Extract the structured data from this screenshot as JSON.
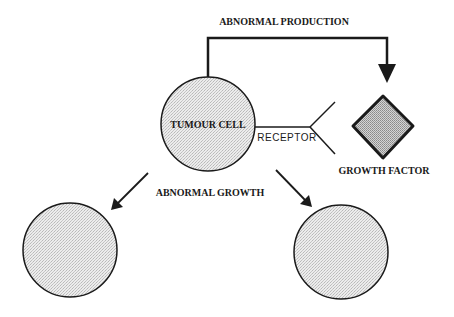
{
  "diagram": {
    "labels": {
      "abnormal_production": "ABNORMAL PRODUCTION",
      "tumour_cell": "TUMOUR CELL",
      "receptor": "RECEPTOR",
      "growth_factor": "GROWTH FACTOR",
      "abnormal_growth": "ABNORMAL GROWTH"
    },
    "nodes": [
      {
        "id": "tumour-cell",
        "shape": "circle",
        "label": "TUMOUR CELL"
      },
      {
        "id": "growth-factor",
        "shape": "diamond",
        "label": "GROWTH FACTOR"
      },
      {
        "id": "receptor",
        "shape": "y-fork",
        "label": "RECEPTOR"
      },
      {
        "id": "daughter-cell-left",
        "shape": "circle",
        "label": ""
      },
      {
        "id": "daughter-cell-right",
        "shape": "circle",
        "label": ""
      }
    ],
    "edges": [
      {
        "from": "tumour-cell",
        "to": "growth-factor",
        "label": "ABNORMAL PRODUCTION"
      },
      {
        "from": "tumour-cell",
        "to": "daughter-cell-left",
        "label": "ABNORMAL GROWTH"
      },
      {
        "from": "tumour-cell",
        "to": "daughter-cell-right",
        "label": "ABNORMAL GROWTH"
      }
    ],
    "colors": {
      "stroke": "#1a1a1a",
      "cell_fill": "#e4e4e4",
      "diamond_fill": "#bdbdbd",
      "background": "#ffffff"
    }
  }
}
